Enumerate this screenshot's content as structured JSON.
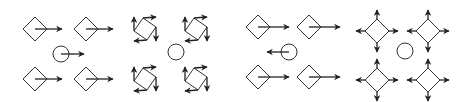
{
  "colors": {
    "stroke": "#333333",
    "arrow": "#222222",
    "background": "#ffffff"
  },
  "panels": [
    {
      "id": "panel-1",
      "kind": "translation-right",
      "units": [
        {
          "cx": 35,
          "cy": 29,
          "arrows": [
            [
              35,
              29,
              62,
              29
            ]
          ]
        },
        {
          "cx": 86,
          "cy": 29,
          "arrows": [
            [
              86,
              29,
              113,
              29
            ]
          ]
        },
        {
          "cx": 35,
          "cy": 79,
          "arrows": [
            [
              35,
              79,
              62,
              79
            ]
          ]
        },
        {
          "cx": 86,
          "cy": 79,
          "arrows": [
            [
              86,
              79,
              113,
              79
            ]
          ]
        }
      ],
      "circle": {
        "cx": 61,
        "cy": 54,
        "r": 8,
        "arrows": [
          [
            61,
            54,
            84,
            54
          ]
        ]
      }
    },
    {
      "id": "panel-2",
      "kind": "rotation",
      "units": [
        {
          "cx": 145,
          "cy": 29
        },
        {
          "cx": 196,
          "cy": 29
        },
        {
          "cx": 145,
          "cy": 79
        },
        {
          "cx": 196,
          "cy": 79
        }
      ],
      "circle": {
        "cx": 176,
        "cy": 52,
        "r": 8,
        "arrows": []
      }
    },
    {
      "id": "panel-3",
      "kind": "translation-right-circle-left",
      "units": [
        {
          "cx": 258,
          "cy": 27,
          "arrows": [
            [
              258,
              27,
              289,
              27
            ]
          ]
        },
        {
          "cx": 309,
          "cy": 27,
          "arrows": [
            [
              309,
              27,
              340,
              27
            ]
          ]
        },
        {
          "cx": 258,
          "cy": 77,
          "arrows": [
            [
              258,
              77,
              289,
              77
            ]
          ]
        },
        {
          "cx": 309,
          "cy": 77,
          "arrows": [
            [
              309,
              77,
              340,
              77
            ]
          ]
        }
      ],
      "circle": {
        "cx": 289,
        "cy": 52,
        "r": 8,
        "arrows": [
          [
            289,
            52,
            267,
            52
          ]
        ]
      }
    },
    {
      "id": "panel-4",
      "kind": "expansion",
      "units": [
        {
          "cx": 377,
          "cy": 31
        },
        {
          "cx": 428,
          "cy": 31
        },
        {
          "cx": 377,
          "cy": 80
        },
        {
          "cx": 428,
          "cy": 80
        }
      ],
      "circle": {
        "cx": 405,
        "cy": 51,
        "r": 8,
        "arrows": []
      }
    }
  ],
  "diamond_half_size": 12
}
